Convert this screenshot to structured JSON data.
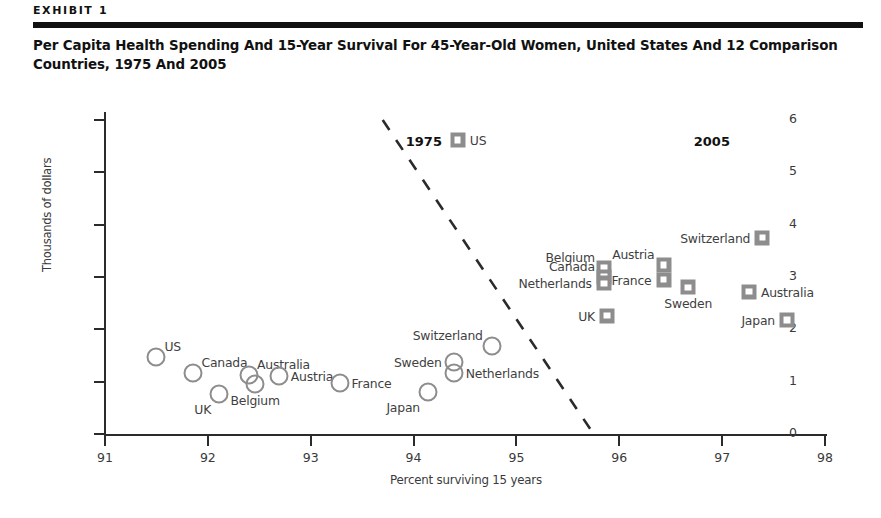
{
  "header": {
    "exhibit_label": "EXHIBIT 1",
    "title": "Per Capita Health Spending And 15-Year Survival For 45-Year-Old Women, United States And 12 Comparison Countries, 1975 And 2005"
  },
  "chart_data": {
    "type": "scatter",
    "title": "Per Capita Health Spending And 15-Year Survival For 45-Year-Old Women, United States And 12 Comparison Countries, 1975 And 2005",
    "xlabel": "Percent surviving 15 years",
    "ylabel": "Thousands of dollars",
    "xlim": [
      91,
      98
    ],
    "ylim": [
      0,
      6
    ],
    "xticks": [
      "91",
      "92",
      "93",
      "94",
      "95",
      "96",
      "97",
      "98"
    ],
    "yticks": [
      "0",
      "1",
      "2",
      "3",
      "4",
      "5",
      "6"
    ],
    "grid": false,
    "legend": "none",
    "annotations": [
      {
        "text": "1975",
        "x": 94.1,
        "y": 5.6
      },
      {
        "text": "2005",
        "x": 96.9,
        "y": 5.6
      }
    ],
    "divider": {
      "style": "dashed",
      "x_start": 93.7,
      "y_start": 6.0,
      "x_end": 95.75,
      "y_end": 0.0
    },
    "series": [
      {
        "name": "1975",
        "marker": "open-circle",
        "color": "#8d8d8d",
        "points": [
          {
            "country": "US",
            "x": 91.5,
            "y": 1.48,
            "label_pos": "upper-right"
          },
          {
            "country": "Canada",
            "x": 91.86,
            "y": 1.17,
            "label_pos": "upper-right"
          },
          {
            "country": "UK",
            "x": 92.11,
            "y": 0.77,
            "label_pos": "below-left"
          },
          {
            "country": "Australia",
            "x": 92.4,
            "y": 1.13,
            "label_pos": "upper-right"
          },
          {
            "country": "Belgium",
            "x": 92.46,
            "y": 0.95,
            "label_pos": "below"
          },
          {
            "country": "Austria",
            "x": 92.69,
            "y": 1.1,
            "label_pos": "right"
          },
          {
            "country": "France",
            "x": 93.28,
            "y": 0.98,
            "label_pos": "right"
          },
          {
            "country": "Japan",
            "x": 94.14,
            "y": 0.8,
            "label_pos": "below-left"
          },
          {
            "country": "Sweden",
            "x": 94.39,
            "y": 1.37,
            "label_pos": "left"
          },
          {
            "country": "Netherlands",
            "x": 94.39,
            "y": 1.16,
            "label_pos": "right"
          },
          {
            "country": "Switzerland",
            "x": 94.76,
            "y": 1.69,
            "label_pos": "upper-left"
          }
        ]
      },
      {
        "name": "2005",
        "marker": "filled-square",
        "color": "#8d8d8d",
        "points": [
          {
            "country": "US",
            "x": 94.43,
            "y": 5.62,
            "label_pos": "right"
          },
          {
            "country": "Belgium",
            "x": 95.85,
            "y": 3.17,
            "label_pos": "upper-left"
          },
          {
            "country": "Canada",
            "x": 95.85,
            "y": 3.0,
            "label_pos": "upper-left"
          },
          {
            "country": "Netherlands",
            "x": 95.85,
            "y": 2.88,
            "label_pos": "left"
          },
          {
            "country": "UK",
            "x": 95.88,
            "y": 2.26,
            "label_pos": "left"
          },
          {
            "country": "Austria",
            "x": 96.43,
            "y": 3.23,
            "label_pos": "upper-left"
          },
          {
            "country": "France",
            "x": 96.43,
            "y": 2.95,
            "label_pos": "left"
          },
          {
            "country": "Sweden",
            "x": 96.67,
            "y": 2.8,
            "label_pos": "below"
          },
          {
            "country": "Switzerland",
            "x": 97.39,
            "y": 3.75,
            "label_pos": "left"
          },
          {
            "country": "Australia",
            "x": 97.26,
            "y": 2.72,
            "label_pos": "right"
          },
          {
            "country": "Japan",
            "x": 97.63,
            "y": 2.18,
            "label_pos": "left"
          }
        ]
      }
    ]
  }
}
